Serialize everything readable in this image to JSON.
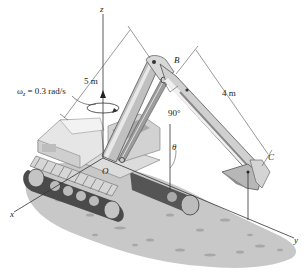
{
  "figure": {
    "axes": {
      "x_label": "x",
      "y_label": "y",
      "z_label": "z",
      "origin_label": "O"
    },
    "points": {
      "B": "B",
      "C": "C"
    },
    "annotations": {
      "angular_velocity": "ω",
      "angular_velocity_subscript": "z",
      "angular_velocity_value": " = 0.3 rad/s",
      "length_OB": "5 m",
      "length_BC": "4 m",
      "angle_B": "90°",
      "angle_theta": "θ"
    },
    "colors": {
      "ground": "#c9c9c9",
      "machine_light": "#e4e4e4",
      "machine_mid": "#b8b8b8",
      "machine_dark": "#6e6e6e",
      "track_dark": "#4a4a4a",
      "line": "#333333"
    }
  }
}
